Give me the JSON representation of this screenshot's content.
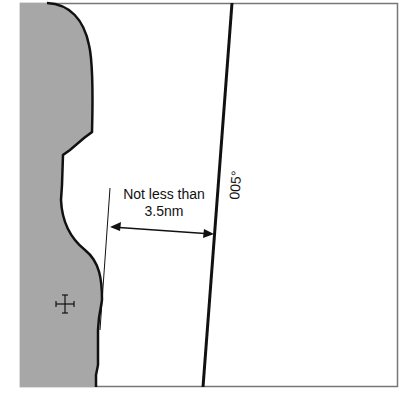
{
  "diagram": {
    "distance_label": {
      "line1": "Not less than",
      "line2": "3.5nm"
    },
    "bearing_label": "005°",
    "colors": {
      "land": "#a7a7a7",
      "coastline": "#111111",
      "frame": "#777777",
      "sea": "#ffffff"
    },
    "symbols": {
      "landmark": "cross-landmark-icon"
    }
  }
}
